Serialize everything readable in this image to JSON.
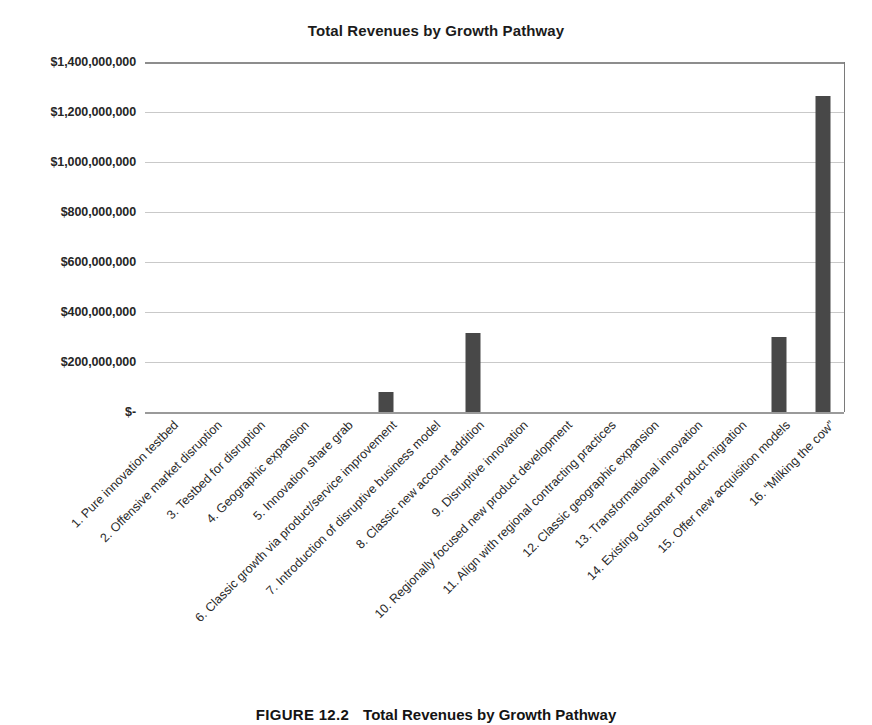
{
  "chart_data": {
    "type": "bar",
    "title": "Total Revenues by Growth Pathway",
    "xlabel": "",
    "ylabel": "",
    "ylim": [
      0,
      1400000000
    ],
    "grid": true,
    "legend": "none",
    "orientation": "vertical",
    "bar_color": "#484848",
    "ytick_labels": [
      "$1,400,000,000",
      "$1,200,000,000",
      "$1,000,000,000",
      "$800,000,000",
      "$600,000,000",
      "$400,000,000",
      "$200,000,000",
      "$-"
    ],
    "ytick_values": [
      1400000000,
      1200000000,
      1000000000,
      800000000,
      600000000,
      400000000,
      200000000,
      0
    ],
    "categories": [
      "1. Pure innovation testbed",
      "2. Offensive market disruption",
      "3. Testbed for disruption",
      "4. Geographic expansion",
      "5. Innovation share grab",
      "6. Classic growth via product/service improvement",
      "7. Introduction of disruptive business model",
      "8. Classic new account addition",
      "9. Disruptive innovation",
      "10. Regionally focused new product development",
      "11. Align with regional contracting practices",
      "12. Classic geographic expansion",
      "13. Transformational innovation",
      "14. Existing customer product migration",
      "15. Offer new acquisition models",
      "16. “Milking the cow”"
    ],
    "values": [
      0,
      0,
      0,
      0,
      0,
      80000000,
      0,
      315000000,
      0,
      0,
      0,
      0,
      0,
      0,
      300000000,
      1265000000
    ]
  },
  "caption": {
    "label": "FIGURE 12.2",
    "text": "Total Revenues by Growth Pathway"
  }
}
